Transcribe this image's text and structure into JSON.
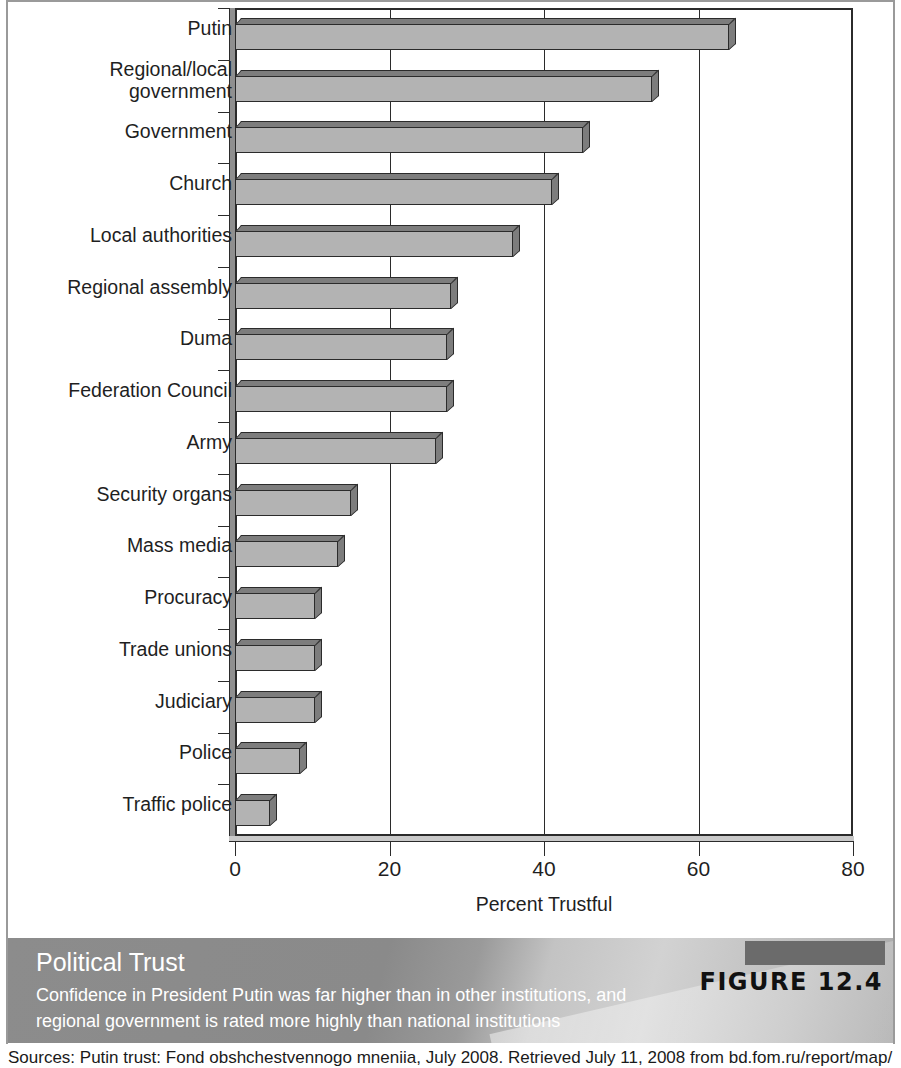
{
  "figure": {
    "label": "FIGURE 12.4",
    "caption_title": "Political Trust",
    "caption_text": "Confidence in President Putin was far higher than in other institutions, and regional government is rated more highly than national institutions",
    "sources": "Sources: Putin trust: Fond obshchestvennogo mneniia, July 2008. Retrieved July 11, 2008 from bd.fom.ru/report/map/"
  },
  "chart_data": {
    "type": "bar",
    "orientation": "horizontal",
    "title": "Political Trust",
    "xlabel": "Percent Trustful",
    "ylabel": "",
    "xlim": [
      0,
      80
    ],
    "xticks": [
      0,
      20,
      40,
      60,
      80
    ],
    "xtick_labels": [
      "0",
      "20",
      "40",
      "60",
      "80"
    ],
    "grid": "vertical",
    "legend": "none",
    "bar_color": "#b3b3b3",
    "bar_edge_color": "#2b2b2b",
    "bar_shade_color": "#7d7d7d",
    "categories": [
      "Putin",
      "Regional/local\ngovernment",
      "Government",
      "Church",
      "Local authorities",
      "Regional assembly",
      "Duma",
      "Federation Council",
      "Army",
      "Security organs",
      "Mass media",
      "Procuracy",
      "Trade unions",
      "Judiciary",
      "Police",
      "Traffic police"
    ],
    "values": [
      64,
      54,
      45,
      41,
      36,
      28,
      27.5,
      27.5,
      26,
      15,
      13.3,
      10.4,
      10.4,
      10.4,
      8.4,
      4.5
    ]
  }
}
